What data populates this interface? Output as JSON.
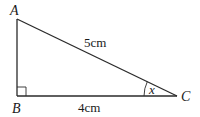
{
  "diagram": {
    "type": "right-triangle",
    "vertices": [
      {
        "name": "A",
        "label": "A"
      },
      {
        "name": "B",
        "label": "B"
      },
      {
        "name": "C",
        "label": "C"
      }
    ],
    "sides": {
      "hypotenuse_AC": "5cm",
      "base_BC": "4cm"
    },
    "angle_label": "x",
    "right_angle_at": "B",
    "colors": {
      "stroke": "#2a2a2a",
      "text": "#1a1a1a",
      "background": "#ffffff"
    }
  }
}
